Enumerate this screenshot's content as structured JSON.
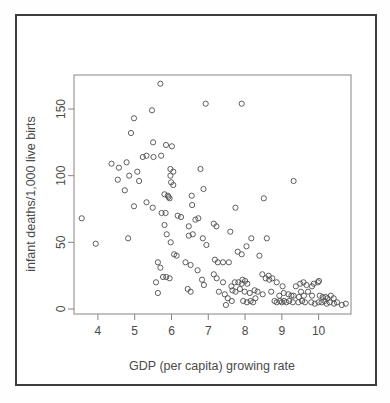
{
  "chart_data": {
    "type": "scatter",
    "title": "",
    "xlabel": "GDP (per capita) growing rate",
    "ylabel": "infant deaths/1,000 live birts",
    "x_ticks": [
      4,
      5,
      6,
      7,
      8,
      9,
      10
    ],
    "y_ticks": [
      0,
      50,
      100,
      150
    ],
    "xlim": [
      3.35,
      10.88
    ],
    "ylim": [
      -3.75,
      175.5
    ],
    "grid": false,
    "legend_position": "none",
    "marker": "open-circle",
    "marker_color": "#4d4d4d",
    "frame_color": "#3c3c3c",
    "box_color": "#858585",
    "points": [
      [
        5.7,
        169
      ],
      [
        6.93,
        154
      ],
      [
        7.91,
        154
      ],
      [
        5.47,
        149
      ],
      [
        4.98,
        143
      ],
      [
        4.9,
        132
      ],
      [
        5.5,
        125
      ],
      [
        5.85,
        123
      ],
      [
        6.01,
        122
      ],
      [
        4.37,
        109
      ],
      [
        4.57,
        106
      ],
      [
        4.78,
        110
      ],
      [
        5.22,
        114
      ],
      [
        5.32,
        115
      ],
      [
        5.51,
        114
      ],
      [
        5.72,
        115
      ],
      [
        4.85,
        100
      ],
      [
        5.07,
        103
      ],
      [
        5.12,
        96
      ],
      [
        4.54,
        97
      ],
      [
        4.73,
        89
      ],
      [
        5.97,
        105
      ],
      [
        6.05,
        103
      ],
      [
        6.79,
        105
      ],
      [
        5.97,
        100
      ],
      [
        5.99,
        95
      ],
      [
        6.05,
        93
      ],
      [
        9.32,
        96
      ],
      [
        6.87,
        90
      ],
      [
        5.81,
        86
      ],
      [
        5.9,
        85
      ],
      [
        5.92,
        84
      ],
      [
        5.95,
        83
      ],
      [
        6.55,
        85
      ],
      [
        8.51,
        83
      ],
      [
        4.98,
        77
      ],
      [
        5.32,
        80
      ],
      [
        5.49,
        76
      ],
      [
        6.56,
        78
      ],
      [
        7.74,
        76
      ],
      [
        3.56,
        68
      ],
      [
        5.73,
        72
      ],
      [
        5.84,
        72
      ],
      [
        6.17,
        70
      ],
      [
        6.26,
        69
      ],
      [
        6.65,
        67
      ],
      [
        6.73,
        68
      ],
      [
        5.81,
        63
      ],
      [
        6.47,
        62
      ],
      [
        7.15,
        64
      ],
      [
        7.22,
        62
      ],
      [
        3.94,
        49
      ],
      [
        4.82,
        53
      ],
      [
        5.87,
        56
      ],
      [
        6.47,
        55
      ],
      [
        6.58,
        56
      ],
      [
        6.85,
        53
      ],
      [
        5.98,
        50
      ],
      [
        6.95,
        48
      ],
      [
        7.6,
        58
      ],
      [
        8.17,
        53
      ],
      [
        8.59,
        53
      ],
      [
        8.04,
        47
      ],
      [
        6.07,
        41
      ],
      [
        6.14,
        40
      ],
      [
        6.38,
        35
      ],
      [
        6.52,
        33
      ],
      [
        5.63,
        35
      ],
      [
        5.7,
        31
      ],
      [
        7.18,
        37
      ],
      [
        7.26,
        35
      ],
      [
        7.4,
        35
      ],
      [
        7.56,
        35
      ],
      [
        7.8,
        43
      ],
      [
        7.91,
        41
      ],
      [
        8.39,
        40
      ],
      [
        6.71,
        29
      ],
      [
        5.77,
        24
      ],
      [
        5.86,
        24
      ],
      [
        5.95,
        23
      ],
      [
        5.58,
        20
      ],
      [
        6.83,
        22
      ],
      [
        6.88,
        18
      ],
      [
        7.15,
        26
      ],
      [
        7.23,
        23
      ],
      [
        7.4,
        20
      ],
      [
        7.63,
        17
      ],
      [
        7.72,
        20
      ],
      [
        7.82,
        20
      ],
      [
        7.91,
        19
      ],
      [
        7.93,
        22
      ],
      [
        8.0,
        21
      ],
      [
        8.06,
        19
      ],
      [
        8.47,
        26
      ],
      [
        8.56,
        23
      ],
      [
        8.64,
        25
      ],
      [
        8.66,
        22
      ],
      [
        8.74,
        23
      ],
      [
        8.86,
        20
      ],
      [
        9.02,
        17
      ],
      [
        9.38,
        17
      ],
      [
        9.5,
        19
      ],
      [
        9.59,
        20
      ],
      [
        9.67,
        18
      ],
      [
        9.82,
        17
      ],
      [
        9.98,
        20
      ],
      [
        10.01,
        21
      ],
      [
        9.87,
        19
      ],
      [
        6.44,
        15
      ],
      [
        6.52,
        13
      ],
      [
        5.63,
        12
      ],
      [
        7.29,
        13
      ],
      [
        7.45,
        11
      ],
      [
        7.53,
        8
      ],
      [
        7.66,
        14
      ],
      [
        7.74,
        13
      ],
      [
        7.86,
        15
      ],
      [
        7.99,
        13
      ],
      [
        8.13,
        12
      ],
      [
        8.26,
        14
      ],
      [
        8.28,
        8
      ],
      [
        8.34,
        13
      ],
      [
        8.48,
        11
      ],
      [
        8.71,
        13
      ],
      [
        8.93,
        10
      ],
      [
        9.05,
        12
      ],
      [
        9.18,
        11
      ],
      [
        9.26,
        10
      ],
      [
        9.32,
        10
      ],
      [
        9.46,
        9
      ],
      [
        9.52,
        13
      ],
      [
        9.6,
        10
      ],
      [
        9.71,
        13
      ],
      [
        9.82,
        10
      ],
      [
        10.03,
        10
      ],
      [
        10.11,
        9
      ],
      [
        10.19,
        9
      ],
      [
        10.24,
        8
      ],
      [
        10.33,
        10
      ],
      [
        10.41,
        8
      ],
      [
        7.48,
        3
      ],
      [
        7.64,
        6
      ],
      [
        7.95,
        6
      ],
      [
        8.05,
        5
      ],
      [
        8.15,
        6
      ],
      [
        8.22,
        5
      ],
      [
        8.8,
        6
      ],
      [
        8.86,
        5
      ],
      [
        8.95,
        6
      ],
      [
        9.0,
        5
      ],
      [
        9.06,
        6
      ],
      [
        9.12,
        5
      ],
      [
        9.2,
        6
      ],
      [
        9.3,
        5
      ],
      [
        9.45,
        5
      ],
      [
        9.55,
        6
      ],
      [
        9.63,
        5
      ],
      [
        9.8,
        5
      ],
      [
        9.9,
        4
      ],
      [
        10.0,
        5
      ],
      [
        10.08,
        5
      ],
      [
        10.16,
        6
      ],
      [
        10.22,
        4
      ],
      [
        10.3,
        5
      ],
      [
        10.42,
        4
      ],
      [
        10.5,
        5
      ],
      [
        10.63,
        3
      ],
      [
        10.74,
        4
      ]
    ]
  }
}
